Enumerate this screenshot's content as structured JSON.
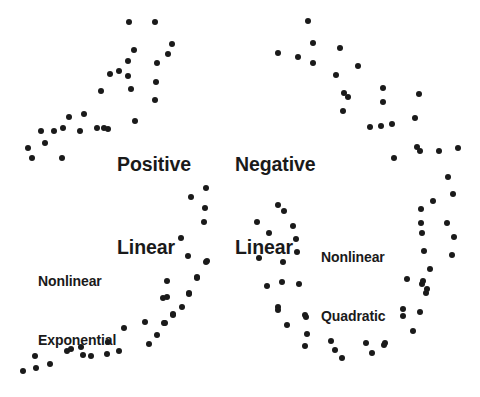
{
  "figure": {
    "width": 480,
    "height": 397,
    "background": "#ffffff",
    "dot_color": "#1a1a1a",
    "dot_radius_px": 3
  },
  "labels": {
    "positive_linear": {
      "line1": "Positive",
      "line2": "Linear",
      "x": 117,
      "y": 96,
      "size": "big"
    },
    "negative_linear": {
      "line1": "Negative",
      "line2": "Linear",
      "x": 235,
      "y": 96,
      "size": "big"
    },
    "nonlinear_exponential": {
      "line1": "Nonlinear",
      "line2": "Exponential",
      "x": 38,
      "y": 232,
      "size": "small"
    },
    "nonlinear_quadratic": {
      "line1": "Nonlinear",
      "line2": "Quadratic",
      "x": 321,
      "y": 208,
      "size": "small"
    }
  },
  "chart_data": {
    "type": "scatter",
    "xlabel": "",
    "ylabel": "",
    "grid": false,
    "axes_visible": false,
    "legend": "none",
    "annotations": [
      {
        "text": "Positive Linear",
        "panel": "top-left"
      },
      {
        "text": "Negative Linear",
        "panel": "top-right"
      },
      {
        "text": "Nonlinear Exponential",
        "panel": "bottom-left"
      },
      {
        "text": "Nonlinear Quadratic",
        "panel": "bottom-right"
      }
    ],
    "series": [
      {
        "name": "Positive Linear",
        "panel": "top-left",
        "marker": "filled-circle",
        "color": "#1a1a1a",
        "points": [
          [
            28,
            148
          ],
          [
            32,
            158
          ],
          [
            41,
            131
          ],
          [
            45,
            143
          ],
          [
            54,
            131
          ],
          [
            62,
            158
          ],
          [
            63,
            128
          ],
          [
            69,
            117
          ],
          [
            80,
            131
          ],
          [
            84,
            114
          ],
          [
            97,
            128
          ],
          [
            101,
            91
          ],
          [
            104,
            128
          ],
          [
            108,
            129
          ],
          [
            110,
            74
          ],
          [
            119,
            71
          ],
          [
            128,
            61
          ],
          [
            128,
            76
          ],
          [
            129,
            22
          ],
          [
            131,
            89
          ],
          [
            134,
            50
          ],
          [
            135,
            121
          ],
          [
            155,
            22
          ],
          [
            156,
            82
          ],
          [
            157,
            63
          ],
          [
            168,
            54
          ],
          [
            155,
            100
          ],
          [
            172,
            44
          ]
        ]
      },
      {
        "name": "Negative Linear",
        "panel": "top-right",
        "marker": "filled-circle",
        "color": "#1a1a1a",
        "points": [
          [
            278,
            53
          ],
          [
            298,
            57
          ],
          [
            308,
            21
          ],
          [
            313,
            43
          ],
          [
            313,
            63
          ],
          [
            336,
            75
          ],
          [
            340,
            48
          ],
          [
            358,
            66
          ],
          [
            344,
            93
          ],
          [
            348,
            97
          ],
          [
            343,
            111
          ],
          [
            383,
            88
          ],
          [
            383,
            102
          ],
          [
            419,
            94
          ],
          [
            415,
            118
          ],
          [
            370,
            127
          ],
          [
            381,
            126
          ],
          [
            392,
            124
          ],
          [
            417,
            147
          ],
          [
            420,
            151
          ],
          [
            439,
            151
          ],
          [
            394,
            158
          ],
          [
            458,
            148
          ],
          [
            448,
            177
          ]
        ]
      },
      {
        "name": "Nonlinear Exponential",
        "panel": "bottom-left",
        "marker": "filled-circle",
        "color": "#1a1a1a",
        "points": [
          [
            23,
            371
          ],
          [
            35,
            356
          ],
          [
            36,
            368
          ],
          [
            50,
            364
          ],
          [
            67,
            351
          ],
          [
            71,
            349
          ],
          [
            81,
            347
          ],
          [
            83,
            355
          ],
          [
            91,
            356
          ],
          [
            107,
            354
          ],
          [
            108,
            342
          ],
          [
            119,
            351
          ],
          [
            124,
            328
          ],
          [
            145,
            322
          ],
          [
            149,
            344
          ],
          [
            157,
            335
          ],
          [
            163,
            298
          ],
          [
            164,
            323
          ],
          [
            165,
            323
          ],
          [
            167,
            281
          ],
          [
            167,
            297
          ],
          [
            173,
            314
          ],
          [
            173,
            315
          ],
          [
            182,
            307
          ],
          [
            188,
            256
          ],
          [
            189,
            293
          ],
          [
            189,
            294
          ],
          [
            197,
            277
          ],
          [
            197,
            278
          ],
          [
            204,
            222
          ],
          [
            205,
            208
          ],
          [
            206,
            188
          ],
          [
            206,
            262
          ],
          [
            191,
            197
          ],
          [
            181,
            238
          ],
          [
            207,
            261
          ]
        ]
      },
      {
        "name": "Nonlinear Quadratic",
        "panel": "bottom-right",
        "marker": "filled-circle",
        "color": "#1a1a1a",
        "points": [
          [
            257,
            222
          ],
          [
            259,
            258
          ],
          [
            267,
            286
          ],
          [
            269,
            233
          ],
          [
            278,
            205
          ],
          [
            278,
            307
          ],
          [
            282,
            282
          ],
          [
            283,
            262
          ],
          [
            284,
            211
          ],
          [
            293,
            226
          ],
          [
            296,
            239
          ],
          [
            297,
            252
          ],
          [
            299,
            284
          ],
          [
            305,
            315
          ],
          [
            278,
            310
          ],
          [
            287,
            325
          ],
          [
            306,
            317
          ],
          [
            307,
            334
          ],
          [
            305,
            346
          ],
          [
            331,
            341
          ],
          [
            335,
            350
          ],
          [
            342,
            358
          ],
          [
            366,
            343
          ],
          [
            372,
            353
          ],
          [
            384,
            345
          ],
          [
            385,
            343
          ],
          [
            403,
            309
          ],
          [
            403,
            316
          ],
          [
            407,
            279
          ],
          [
            413,
            331
          ],
          [
            420,
            312
          ],
          [
            421,
            209
          ],
          [
            421,
            223
          ],
          [
            422,
            233
          ],
          [
            422,
            284
          ],
          [
            423,
            281
          ],
          [
            424,
            251
          ],
          [
            426,
            293
          ],
          [
            427,
            289
          ],
          [
            430,
            269
          ],
          [
            433,
            201
          ],
          [
            447,
            223
          ],
          [
            452,
            255
          ],
          [
            453,
            194
          ],
          [
            454,
            237
          ]
        ]
      }
    ]
  }
}
